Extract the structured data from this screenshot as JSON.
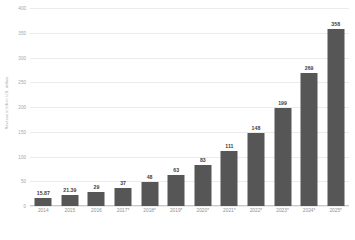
{
  "chart_data": {
    "type": "bar",
    "title": "",
    "subtitle": "",
    "xlabel": "",
    "ylabel": "Revenue in billion U.S. dollars",
    "categories": [
      "2014",
      "2015",
      "2016",
      "2017*",
      "2018*",
      "2019*",
      "2020*",
      "2021*",
      "2022*",
      "2023*",
      "2024*",
      "2025*"
    ],
    "values": [
      15.87,
      21.39,
      29,
      37,
      48,
      63,
      83,
      111,
      148,
      199,
      269,
      358
    ],
    "value_labels": [
      "15.87",
      "21.39",
      "29",
      "37",
      "48",
      "63",
      "83",
      "111",
      "148",
      "199",
      "269",
      "358"
    ],
    "ylim": [
      0,
      400
    ],
    "y_ticks": [
      0,
      50,
      100,
      150,
      200,
      250,
      300,
      350,
      400
    ],
    "y_tick_labels": [
      "0",
      "50",
      "100",
      "150",
      "200",
      "250",
      "300",
      "350",
      "400"
    ],
    "grid": true,
    "legend": false,
    "legend_position": "none",
    "series": [
      {
        "name": "Revenue",
        "color": "#565656",
        "values": [
          15.87,
          21.39,
          29,
          37,
          48,
          63,
          83,
          111,
          148,
          199,
          269,
          358
        ]
      }
    ]
  },
  "footer": {
    "caption": ""
  },
  "colors": {
    "bar": "#565656",
    "gridline": "#ebebeb",
    "axis_line": "#c9c9c9",
    "tick_text": "#9a9a9a",
    "value_text": "#3d3d3d",
    "background": "#ffffff"
  }
}
